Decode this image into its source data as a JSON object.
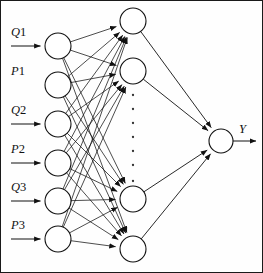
{
  "diagram": {
    "layers": {
      "input": {
        "name": "input-layer",
        "count": 6,
        "nodes": [
          {
            "label_var": "Q",
            "label_sub": "1",
            "label": "Q1",
            "has_arrow": true,
            "cx": 57,
            "cy": 45,
            "r": 13
          },
          {
            "label_var": "P",
            "label_sub": "1",
            "label": "P1",
            "has_arrow": false,
            "cx": 57,
            "cy": 84,
            "r": 13
          },
          {
            "label_var": "Q",
            "label_sub": "2",
            "label": "Q2",
            "has_arrow": true,
            "cx": 57,
            "cy": 123,
            "r": 13
          },
          {
            "label_var": "P",
            "label_sub": "2",
            "label": "P2",
            "has_arrow": true,
            "cx": 57,
            "cy": 162,
            "r": 13
          },
          {
            "label_var": "Q",
            "label_sub": "3",
            "label": "Q3",
            "has_arrow": true,
            "cx": 57,
            "cy": 200,
            "r": 13
          },
          {
            "label_var": "P",
            "label_sub": "3",
            "label": "P3",
            "has_arrow": true,
            "cx": 57,
            "cy": 238,
            "r": 13
          }
        ]
      },
      "hidden": {
        "name": "hidden-layer",
        "visible_count": 4,
        "ellipsis_dots": 7,
        "nodes": [
          {
            "cx": 132,
            "cy": 20,
            "r": 13
          },
          {
            "cx": 132,
            "cy": 70,
            "r": 13
          },
          {
            "cx": 132,
            "cy": 198,
            "r": 13
          },
          {
            "cx": 132,
            "cy": 248,
            "r": 13
          }
        ],
        "dots": [
          {
            "cx": 132,
            "cy": 94
          },
          {
            "cx": 132,
            "cy": 108
          },
          {
            "cx": 132,
            "cy": 122
          },
          {
            "cx": 132,
            "cy": 136
          },
          {
            "cx": 132,
            "cy": 150
          },
          {
            "cx": 132,
            "cy": 164
          },
          {
            "cx": 132,
            "cy": 180
          }
        ]
      },
      "output": {
        "name": "output-layer",
        "count": 1,
        "nodes": [
          {
            "label": "Y",
            "cx": 220,
            "cy": 140,
            "r": 12
          }
        ]
      }
    },
    "labels": {
      "output_label": "Y"
    },
    "colors": {
      "stroke": "#111111",
      "node_fill": "#ffffff",
      "background": "#fefefe",
      "border": "#1a1a1a"
    }
  }
}
